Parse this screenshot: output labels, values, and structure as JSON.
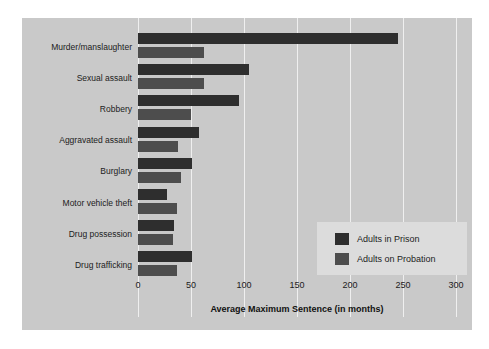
{
  "chart_data": {
    "type": "bar",
    "orientation": "horizontal",
    "title": "",
    "xlabel": "Average Maximum Sentence (in months)",
    "ylabel": "",
    "xlim": [
      0,
      300
    ],
    "xticks": [
      0,
      50,
      100,
      150,
      200,
      250,
      300
    ],
    "xtick_labels": [
      "0",
      "50",
      "100",
      "150",
      "200",
      "250",
      "300"
    ],
    "grid": true,
    "legend_position": "center-right",
    "categories": [
      "Murder/manslaughter",
      "Sexual assault",
      "Robbery",
      "Aggravated assault",
      "Burglary",
      "Motor vehicle theft",
      "Drug possession",
      "Drug trafficking"
    ],
    "series": [
      {
        "name": "Adults in Prison",
        "color": "#2e2e2e",
        "values": [
          245,
          105,
          95,
          58,
          51,
          27,
          34,
          51
        ]
      },
      {
        "name": "Adults on Probation",
        "color": "#4d4d4d",
        "values": [
          62,
          62,
          50,
          38,
          41,
          37,
          33,
          37
        ]
      }
    ]
  },
  "legend": {
    "entries": [
      {
        "label": "Adults in Prison",
        "color": "#2e2e2e"
      },
      {
        "label": "Adults on Probation",
        "color": "#4d4d4d"
      }
    ]
  },
  "style": {
    "panel_background": "#c9c9c9",
    "page_background": "#ffffff",
    "gridline_color": "#efefef",
    "legend_background": "#dcdcdc",
    "text_color": "#1c1c1c"
  }
}
